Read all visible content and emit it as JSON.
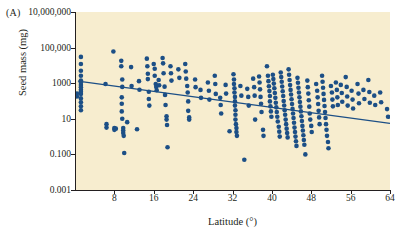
{
  "figure": {
    "panel_label": "(A)",
    "background_color": "#ffffff",
    "plot_background_color": "#f7edcf",
    "point_color": "#1c4f86",
    "line_color": "#1c4f86",
    "axis_color": "#231f20"
  },
  "chart_data": {
    "type": "scatter",
    "title": "",
    "xlabel": "Latitude (°)",
    "ylabel": "Seed mass (mg)",
    "xlim": [
      0,
      64
    ],
    "ylim": [
      0.001,
      10000000
    ],
    "yscale": "log",
    "grid": false,
    "legend": null,
    "xticks": [
      8,
      16,
      24,
      32,
      40,
      48,
      56,
      64
    ],
    "xtick_labels": [
      "8",
      "16",
      "24",
      "32",
      "40",
      "48",
      "56",
      "64"
    ],
    "yticks": [
      0.001,
      0.1,
      10,
      1000,
      100000,
      10000000
    ],
    "ytick_labels": [
      "0.001",
      "0.100",
      "10",
      "1000",
      "100,000",
      "10,000,000"
    ],
    "trendline": {
      "description": "negative log-linear regression of seed mass on latitude",
      "x_start": 0.6,
      "y_start": 1300,
      "x_end": 64,
      "y_end": 5.5
    },
    "points": [
      [
        1.2,
        30000
      ],
      [
        1.2,
        12000
      ],
      [
        1.2,
        5000
      ],
      [
        1.2,
        2600
      ],
      [
        1.2,
        1400
      ],
      [
        1.2,
        800
      ],
      [
        1.2,
        430
      ],
      [
        1.2,
        250
      ],
      [
        1.2,
        140
      ],
      [
        1.2,
        85
      ],
      [
        1.2,
        50
      ],
      [
        1.2,
        30
      ],
      [
        1.2,
        1100
      ],
      [
        1.2,
        600
      ],
      [
        1.2,
        330
      ],
      [
        0.4,
        260
      ],
      [
        0.4,
        180
      ],
      [
        7.8,
        60000
      ],
      [
        6.2,
        900
      ],
      [
        6.4,
        5.0
      ],
      [
        6.4,
        3.2
      ],
      [
        8.0,
        3.0
      ],
      [
        8.0,
        2.4
      ],
      [
        8.3,
        2.8
      ],
      [
        9.4,
        18000
      ],
      [
        9.4,
        9000
      ],
      [
        9.6,
        1600
      ],
      [
        9.6,
        620
      ],
      [
        9.5,
        160
      ],
      [
        9.5,
        70
      ],
      [
        9.5,
        26
      ],
      [
        9.6,
        10
      ],
      [
        9.8,
        3.0
      ],
      [
        9.8,
        2.2
      ],
      [
        9.8,
        1.6
      ],
      [
        9.9,
        1.1
      ],
      [
        10.0,
        0.12
      ],
      [
        10.6,
        6.5
      ],
      [
        11.4,
        8000
      ],
      [
        11.5,
        700
      ],
      [
        12.6,
        2.6
      ],
      [
        13.0,
        1300
      ],
      [
        13.1,
        430
      ],
      [
        14.6,
        24000
      ],
      [
        14.7,
        9000
      ],
      [
        14.8,
        3400
      ],
      [
        14.8,
        1700
      ],
      [
        15.0,
        330
      ],
      [
        15.0,
        130
      ],
      [
        15.1,
        55
      ],
      [
        16.0,
        12000
      ],
      [
        16.2,
        6500
      ],
      [
        16.2,
        2600
      ],
      [
        16.4,
        900
      ],
      [
        16.5,
        620
      ],
      [
        16.6,
        400
      ],
      [
        17.0,
        1500
      ],
      [
        17.1,
        760
      ],
      [
        17.8,
        26000
      ],
      [
        17.9,
        13000
      ],
      [
        18.0,
        3600
      ],
      [
        18.2,
        640
      ],
      [
        18.3,
        220
      ],
      [
        18.4,
        60
      ],
      [
        18.6,
        14
      ],
      [
        18.6,
        9
      ],
      [
        18.7,
        4.5
      ],
      [
        18.8,
        0.25
      ],
      [
        19.4,
        9000
      ],
      [
        19.5,
        3600
      ],
      [
        19.6,
        1400
      ],
      [
        21.0,
        6000
      ],
      [
        21.2,
        2000
      ],
      [
        22.4,
        12000
      ],
      [
        22.5,
        4500
      ],
      [
        22.6,
        1800
      ],
      [
        22.8,
        700
      ],
      [
        22.9,
        300
      ],
      [
        23.0,
        95
      ],
      [
        23.0,
        28
      ],
      [
        23.2,
        12
      ],
      [
        23.2,
        9
      ],
      [
        24.4,
        1600
      ],
      [
        24.5,
        600
      ],
      [
        25.5,
        420
      ],
      [
        25.6,
        150
      ],
      [
        27.0,
        1100
      ],
      [
        27.2,
        380
      ],
      [
        27.3,
        120
      ],
      [
        28.4,
        2600
      ],
      [
        28.5,
        900
      ],
      [
        28.6,
        250
      ],
      [
        29.5,
        150
      ],
      [
        29.6,
        60
      ],
      [
        29.7,
        20
      ],
      [
        30.6,
        800
      ],
      [
        30.7,
        260
      ],
      [
        31.4,
        2.0
      ],
      [
        32.2,
        3200
      ],
      [
        32.3,
        1600
      ],
      [
        32.3,
        900
      ],
      [
        32.4,
        520
      ],
      [
        32.4,
        300
      ],
      [
        32.5,
        170
      ],
      [
        32.5,
        95
      ],
      [
        32.5,
        55
      ],
      [
        32.6,
        30
      ],
      [
        32.6,
        17
      ],
      [
        32.6,
        9
      ],
      [
        32.7,
        5
      ],
      [
        32.8,
        3
      ],
      [
        32.8,
        1.8
      ],
      [
        32.9,
        1.1
      ],
      [
        33.6,
        700
      ],
      [
        33.8,
        200
      ],
      [
        34.4,
        0.05
      ],
      [
        35.0,
        480
      ],
      [
        35.2,
        170
      ],
      [
        35.3,
        55
      ],
      [
        36.2,
        1800
      ],
      [
        36.4,
        600
      ],
      [
        36.5,
        200
      ],
      [
        36.6,
        9
      ],
      [
        37.4,
        2400
      ],
      [
        37.5,
        1100
      ],
      [
        37.6,
        450
      ],
      [
        37.7,
        170
      ],
      [
        37.8,
        70
      ],
      [
        37.9,
        24
      ],
      [
        38.2,
        2.4
      ],
      [
        38.3,
        1.1
      ],
      [
        39.0,
        9000
      ],
      [
        39.2,
        2600
      ],
      [
        39.3,
        1300
      ],
      [
        39.4,
        680
      ],
      [
        39.5,
        360
      ],
      [
        39.6,
        190
      ],
      [
        39.6,
        95
      ],
      [
        39.7,
        50
      ],
      [
        39.8,
        26
      ],
      [
        39.9,
        13
      ],
      [
        40.2,
        3000
      ],
      [
        40.3,
        1700
      ],
      [
        40.4,
        950
      ],
      [
        40.5,
        520
      ],
      [
        40.6,
        280
      ],
      [
        40.7,
        150
      ],
      [
        40.8,
        80
      ],
      [
        40.9,
        44
      ],
      [
        41.0,
        24
      ],
      [
        41.1,
        13
      ],
      [
        41.2,
        7
      ],
      [
        41.4,
        3.6
      ],
      [
        41.5,
        1.9
      ],
      [
        41.6,
        1.0
      ],
      [
        41.8,
        4000
      ],
      [
        41.9,
        2200
      ],
      [
        42.0,
        1200
      ],
      [
        42.1,
        650
      ],
      [
        42.2,
        350
      ],
      [
        42.3,
        190
      ],
      [
        42.4,
        100
      ],
      [
        42.5,
        56
      ],
      [
        42.6,
        30
      ],
      [
        42.7,
        17
      ],
      [
        42.8,
        9
      ],
      [
        42.9,
        5
      ],
      [
        43.0,
        2.8
      ],
      [
        43.1,
        1.6
      ],
      [
        43.2,
        0.9
      ],
      [
        43.4,
        6000
      ],
      [
        43.5,
        3000
      ],
      [
        43.6,
        1500
      ],
      [
        43.7,
        780
      ],
      [
        43.8,
        420
      ],
      [
        43.9,
        230
      ],
      [
        44.0,
        125
      ],
      [
        44.1,
        68
      ],
      [
        44.2,
        36
      ],
      [
        44.3,
        20
      ],
      [
        44.4,
        11
      ],
      [
        44.5,
        6
      ],
      [
        44.6,
        3.2
      ],
      [
        44.7,
        1.8
      ],
      [
        44.8,
        1.0
      ],
      [
        44.9,
        0.55
      ],
      [
        45.0,
        0.3
      ],
      [
        45.2,
        2000
      ],
      [
        45.3,
        1050
      ],
      [
        45.4,
        560
      ],
      [
        45.5,
        300
      ],
      [
        45.6,
        160
      ],
      [
        45.7,
        88
      ],
      [
        45.8,
        48
      ],
      [
        45.9,
        26
      ],
      [
        46.0,
        14
      ],
      [
        46.1,
        7.5
      ],
      [
        46.2,
        4
      ],
      [
        46.3,
        2.2
      ],
      [
        46.4,
        1.2
      ],
      [
        46.5,
        0.65
      ],
      [
        46.6,
        0.35
      ],
      [
        46.8,
        0.1
      ],
      [
        47.2,
        1400
      ],
      [
        47.3,
        600
      ],
      [
        47.4,
        260
      ],
      [
        47.5,
        110
      ],
      [
        47.6,
        48
      ],
      [
        47.7,
        20
      ],
      [
        47.8,
        9
      ],
      [
        48.0,
        4
      ],
      [
        48.1,
        1.8
      ],
      [
        49.0,
        900
      ],
      [
        49.2,
        380
      ],
      [
        49.3,
        160
      ],
      [
        49.4,
        68
      ],
      [
        49.5,
        28
      ],
      [
        49.6,
        12
      ],
      [
        49.7,
        5
      ],
      [
        50.2,
        2600
      ],
      [
        50.3,
        1200
      ],
      [
        50.4,
        550
      ],
      [
        50.5,
        250
      ],
      [
        50.6,
        115
      ],
      [
        50.7,
        52
      ],
      [
        50.8,
        24
      ],
      [
        50.9,
        11
      ],
      [
        51.0,
        5
      ],
      [
        51.1,
        2.4
      ],
      [
        51.2,
        1.1
      ],
      [
        51.4,
        0.5
      ],
      [
        51.5,
        0.22
      ],
      [
        52.0,
        700
      ],
      [
        52.2,
        300
      ],
      [
        52.3,
        120
      ],
      [
        52.4,
        50
      ],
      [
        53.0,
        1100
      ],
      [
        53.2,
        420
      ],
      [
        53.3,
        160
      ],
      [
        53.4,
        60
      ],
      [
        54.0,
        800
      ],
      [
        54.2,
        280
      ],
      [
        54.3,
        90
      ],
      [
        55.0,
        2200
      ],
      [
        55.2,
        620
      ],
      [
        55.3,
        180
      ],
      [
        55.4,
        55
      ],
      [
        56.2,
        380
      ],
      [
        56.4,
        120
      ],
      [
        56.5,
        38
      ],
      [
        57.4,
        900
      ],
      [
        57.6,
        260
      ],
      [
        57.7,
        75
      ],
      [
        58.6,
        420
      ],
      [
        58.8,
        130
      ],
      [
        59.6,
        1500
      ],
      [
        59.8,
        320
      ],
      [
        59.9,
        80
      ],
      [
        60.8,
        200
      ],
      [
        61.0,
        60
      ],
      [
        62.0,
        300
      ],
      [
        62.2,
        85
      ],
      [
        63.4,
        35
      ],
      [
        63.6,
        13
      ]
    ]
  }
}
